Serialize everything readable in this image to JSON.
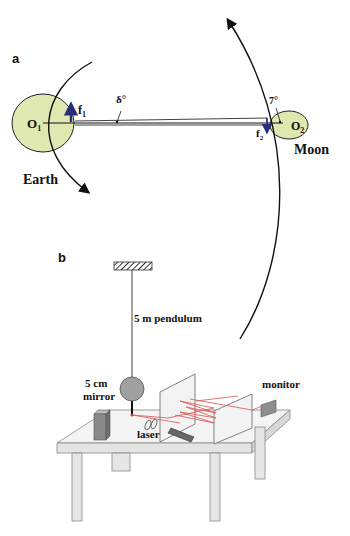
{
  "panel_a": {
    "label": "a",
    "earth": {
      "center_label": "O",
      "center_sub": "1",
      "name": "Earth",
      "force_label": "f",
      "force_sub": "1"
    },
    "moon": {
      "center_label": "O",
      "center_sub": "2",
      "name": "Moon",
      "force_label": "f",
      "force_sub": "2"
    },
    "angle_delta": "δ°",
    "angle_moon": "7°",
    "colors": {
      "body_fill": "#dfe8b0",
      "force_arrow": "#2a2f7a",
      "line": "#111111"
    }
  },
  "panel_b": {
    "label": "b",
    "pendulum_label": "5 m pendulum",
    "mirror_label_line1": "5 cm",
    "mirror_label_line2": "mirror",
    "laser_label": "laser",
    "monitor_label": "monitor",
    "colors": {
      "beam": "#d9534f",
      "table": "#ececec",
      "panel": "#f3f3f3",
      "bob": "#a0a0a0",
      "dark": "#6e6e6e"
    }
  }
}
